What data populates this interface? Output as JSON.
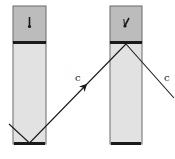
{
  "diagram": {
    "colors": {
      "background": "#ffffff",
      "tube_fill": "#e2e2e2",
      "head_fill": "#bcbcbc",
      "border": "#6a6a6a",
      "mirror": "#1a1a1a",
      "beam": "#1a1a1a"
    },
    "clocks": [
      {
        "id": "left",
        "x": 13,
        "width": 33,
        "top": 6,
        "mirror_top_y": 42,
        "bottom_y": 144,
        "hand": "pointing-down"
      },
      {
        "id": "right",
        "x": 110,
        "width": 32,
        "top": 6,
        "mirror_top_y": 42,
        "bottom_y": 144,
        "hand": "tilted"
      }
    ],
    "beam": {
      "label_1": "c",
      "label_2": "c"
    }
  }
}
